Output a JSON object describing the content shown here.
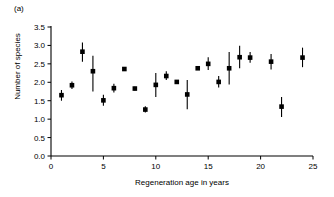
{
  "panel": {
    "label": "(a)"
  },
  "chart_data": {
    "type": "scatter",
    "title": "",
    "subtitle": "",
    "xlabel": "Regeneration age in years",
    "ylabel": "Number of species",
    "xlim": [
      0,
      25
    ],
    "ylim": [
      0.0,
      3.5
    ],
    "xticks": [
      0,
      5,
      10,
      15,
      20,
      25
    ],
    "xticklabels": [
      "0",
      "5",
      "10",
      "15",
      "20",
      "25"
    ],
    "yticks": [
      0.0,
      0.5,
      1.0,
      1.5,
      2.0,
      2.5,
      3.0,
      3.5
    ],
    "yticklabels": [
      "0.0",
      "0.5",
      "1.0",
      "1.5",
      "2.0",
      "2.5",
      "3.0",
      "3.5"
    ],
    "grid": false,
    "legend": null,
    "marker": "filled-square",
    "error_bars": "vertical",
    "x": [
      1,
      2,
      3,
      4,
      5,
      6,
      7,
      8,
      9,
      10,
      11,
      12,
      13,
      14,
      15,
      16,
      17,
      18,
      19,
      21,
      22,
      24
    ],
    "y": [
      1.65,
      1.92,
      2.83,
      2.3,
      1.51,
      1.84,
      2.36,
      1.83,
      1.26,
      1.93,
      2.17,
      2.01,
      1.67,
      2.38,
      2.5,
      2.01,
      2.38,
      2.68,
      2.67,
      2.56,
      1.34,
      2.67
    ],
    "yerr_low": [
      1.5,
      1.82,
      2.56,
      1.75,
      1.36,
      1.72,
      2.36,
      1.78,
      1.18,
      1.6,
      2.06,
      1.98,
      1.27,
      2.38,
      2.33,
      1.86,
      1.94,
      2.38,
      2.53,
      2.35,
      1.06,
      2.41
    ],
    "yerr_high": [
      1.79,
      2.02,
      3.08,
      2.72,
      1.66,
      1.96,
      2.36,
      1.88,
      1.35,
      2.25,
      2.3,
      2.05,
      2.06,
      2.38,
      2.68,
      2.17,
      2.82,
      2.99,
      2.82,
      2.77,
      1.6,
      2.94
    ],
    "series_name": "Number of species"
  },
  "colors": {
    "marker": "#000000",
    "axis": "#000000",
    "background": "#FFFFFF"
  }
}
